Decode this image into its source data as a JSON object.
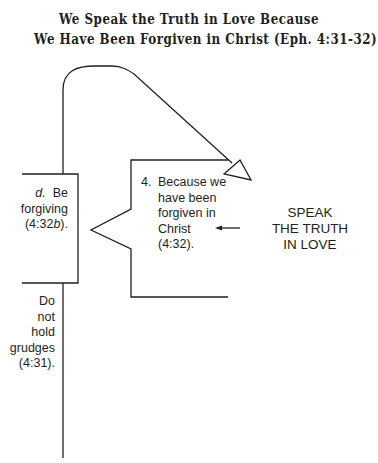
{
  "title": {
    "line1": "We Speak the Truth in Love Because",
    "line2": "We Have Been Forgiven in Christ (Eph. 4:31-32)"
  },
  "diagram": {
    "left_box": {
      "letter": "d.",
      "lines": [
        "Be",
        "forgiving",
        "(4:32b)."
      ]
    },
    "below_line": {
      "lines": [
        "Do",
        "not",
        "hold",
        "grudges",
        "(4:31)."
      ]
    },
    "bracket_point": {
      "number": "4.",
      "lines": [
        "Because we",
        "have been",
        "forgiven in",
        "Christ",
        "(4:32)."
      ]
    },
    "main_idea": {
      "lines": [
        "SPEAK",
        "THE TRUTH",
        "IN LOVE"
      ]
    },
    "colors": {
      "line": "#231f20",
      "background": "#ffffff"
    }
  }
}
